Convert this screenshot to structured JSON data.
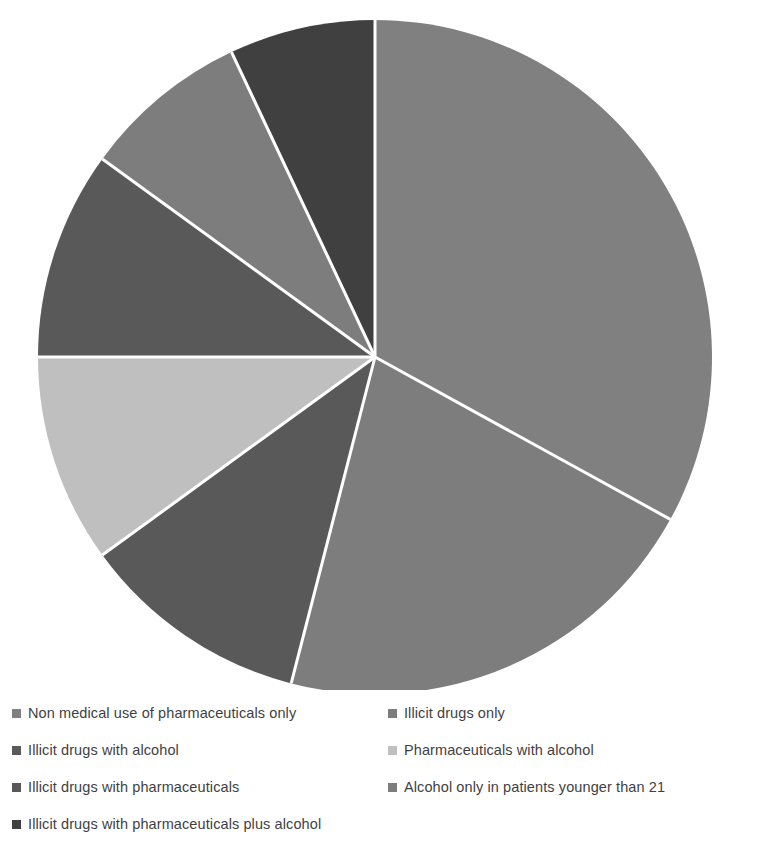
{
  "chart_data": {
    "type": "pie",
    "title": "",
    "subtitle": "",
    "xlabel": "",
    "ylabel": "",
    "legend_position": "bottom",
    "grid": false,
    "start_angle_deg": 0,
    "direction": "clockwise",
    "categories": [
      "Non medical use of pharmaceuticals only",
      "Illicit drugs only",
      "Illicit drugs with alcohol",
      "Pharmaceuticals with alcohol",
      "Illicit drugs with pharmaceuticals",
      "Alcohol only in patients younger than 21",
      "Illicit drugs with pharmaceuticals plus alcohol"
    ],
    "values": [
      33,
      21,
      11,
      10,
      10,
      8,
      7
    ],
    "units": "percent",
    "slices": [
      {
        "label": "Non medical use of pharmaceuticals only",
        "value": 33,
        "color": "#808080",
        "start_deg": 0,
        "end_deg": 118.8
      },
      {
        "label": "Illicit drugs only",
        "value": 21,
        "color": "#7d7d7d",
        "start_deg": 118.8,
        "end_deg": 194.4
      },
      {
        "label": "Illicit drugs with alcohol",
        "value": 11,
        "color": "#595959",
        "start_deg": 194.4,
        "end_deg": 234.0
      },
      {
        "label": "Pharmaceuticals with alcohol",
        "value": 10,
        "color": "#bfbfbf",
        "start_deg": 234.0,
        "end_deg": 270.0
      },
      {
        "label": "Illicit drugs with pharmaceuticals",
        "value": 10,
        "color": "#595959",
        "start_deg": 270.0,
        "end_deg": 306.0
      },
      {
        "label": "Alcohol only in patients younger than 21",
        "value": 8,
        "color": "#7d7d7d",
        "start_deg": 306.0,
        "end_deg": 334.8
      },
      {
        "label": "Illicit drugs with pharmaceuticals plus alcohol",
        "value": 7,
        "color": "#404040",
        "start_deg": 334.8,
        "end_deg": 360.0
      }
    ],
    "geometry": {
      "center_x": 375,
      "center_y": 357,
      "radius": 337,
      "separator_color": "#ffffff",
      "separator_width": 3
    },
    "colors": {
      "medium_gray": "#808080",
      "medium_gray_2": "#7d7d7d",
      "dark_gray": "#595959",
      "light_gray": "#bfbfbf",
      "darkest_gray": "#404040",
      "background": "#ffffff",
      "text": "#3f3f3f"
    }
  },
  "legend": {
    "rows": [
      {
        "left": {
          "label": "Non medical use of pharmaceuticals only",
          "color": "#808080"
        },
        "right": {
          "label": "Illicit drugs only",
          "color": "#7d7d7d"
        }
      },
      {
        "left": {
          "label": "Illicit drugs with alcohol",
          "color": "#595959"
        },
        "right": {
          "label": "Pharmaceuticals with alcohol",
          "color": "#bfbfbf"
        }
      },
      {
        "left": {
          "label": "Illicit drugs with pharmaceuticals",
          "color": "#595959"
        },
        "right": {
          "label": "Alcohol only in patients younger than 21",
          "color": "#7d7d7d"
        }
      },
      {
        "left": {
          "label": "Illicit drugs with pharmaceuticals plus alcohol",
          "color": "#404040"
        },
        "right": null
      }
    ]
  }
}
